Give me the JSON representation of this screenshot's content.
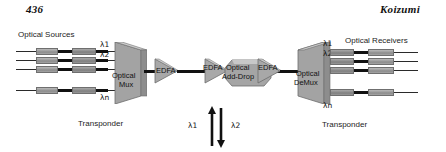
{
  "page": {
    "folio": "436",
    "running_head": "Koizumi"
  },
  "figure": {
    "labels": {
      "optical_sources": "Optical Sources",
      "optical_receivers": "Optical Receivers",
      "transponder_left": "Transponder",
      "transponder_right": "Transponder",
      "optical_mux_line1": "Optical",
      "optical_mux_line2": "Mux",
      "optical_demux_line1": "Optical",
      "optical_demux_line2": "DeMux",
      "add_drop_line1": "Optical",
      "add_drop_line2": "Add-Drop",
      "edfa_1": "EDFA",
      "edfa_2": "EDFA",
      "edfa_3": "EDFA"
    },
    "wavelengths": {
      "mux_lambda_1": "λ1",
      "mux_lambda_2": "λ2",
      "mux_lambda_n": "λn",
      "demux_lambda_1": "λ1",
      "demux_lambda_2": "λ2",
      "demux_lambda_n": "λn",
      "add_lambda": "λ1",
      "drop_lambda": "λ2"
    },
    "colors": {
      "slab_face": "#a0a0a0",
      "slab_top": "#cfcfcf",
      "slab_edge": "#6d6d6d",
      "element_body": "#9a9a9a",
      "line": "#111111",
      "background": "#ffffff"
    },
    "channel_count_shown": 4,
    "source_rows": [
      {
        "lambda": "λ1"
      },
      {
        "lambda": "λ2"
      },
      {
        "lambda": ""
      },
      {
        "lambda": "λn"
      }
    ],
    "receiver_rows": [
      {
        "lambda": "λ1"
      },
      {
        "lambda": "λ2"
      },
      {
        "lambda": ""
      },
      {
        "lambda": "λn"
      }
    ],
    "add_drop_arrows": [
      {
        "direction": "up",
        "name": "add-arrow"
      },
      {
        "direction": "down",
        "name": "drop-arrow"
      }
    ]
  }
}
